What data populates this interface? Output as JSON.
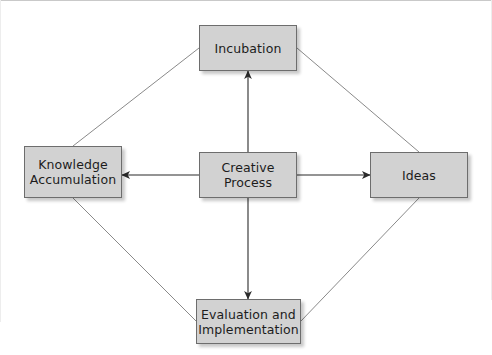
{
  "diagram": {
    "type": "node-link-diagram",
    "canvas": {
      "width": 492,
      "height": 355,
      "background": "#ffffff"
    },
    "style": {
      "node_fill": "#d2d2d2",
      "node_border": "#6d6d6d",
      "edge_color": "#8a8a8a",
      "arrow_color": "#2b2b2b",
      "text_color": "#1c1c1c",
      "frame_color": "#c9c9c9"
    },
    "nodes": [
      {
        "id": "incubation",
        "label": "Incubation",
        "x": 199,
        "y": 25,
        "w": 98,
        "h": 46,
        "position": "top"
      },
      {
        "id": "knowledge-accumulation",
        "label": "Knowledge\nAccumulation",
        "x": 24,
        "y": 146,
        "w": 98,
        "h": 52,
        "position": "left"
      },
      {
        "id": "creative-process",
        "label": "Creative\nProcess",
        "x": 199,
        "y": 152,
        "w": 98,
        "h": 46,
        "position": "center"
      },
      {
        "id": "ideas",
        "label": "Ideas",
        "x": 370,
        "y": 152,
        "w": 98,
        "h": 46,
        "position": "right"
      },
      {
        "id": "evaluation-implementation",
        "label": "Evaluation and\nImplementation",
        "x": 196,
        "y": 299,
        "w": 105,
        "h": 45,
        "position": "bottom"
      }
    ],
    "edges": [
      {
        "id": "creative-process-to-incubation",
        "from": "creative-process",
        "to": "incubation",
        "kind": "arrow",
        "direction": "up",
        "x1": 248,
        "y1": 152,
        "x2": 248,
        "y2": 71
      },
      {
        "id": "creative-process-to-knowledge-accumulation",
        "from": "creative-process",
        "to": "knowledge-accumulation",
        "kind": "arrow",
        "direction": "left",
        "x1": 199,
        "y1": 175,
        "x2": 122,
        "y2": 175
      },
      {
        "id": "creative-process-to-ideas",
        "from": "creative-process",
        "to": "ideas",
        "kind": "arrow",
        "direction": "right",
        "x1": 297,
        "y1": 175,
        "x2": 370,
        "y2": 175
      },
      {
        "id": "creative-process-to-evaluation-implementation",
        "from": "creative-process",
        "to": "evaluation-implementation",
        "kind": "arrow",
        "direction": "down",
        "x1": 248,
        "y1": 198,
        "x2": 248,
        "y2": 299
      },
      {
        "id": "knowledge-accumulation-to-incubation",
        "from": "knowledge-accumulation",
        "to": "incubation",
        "kind": "line",
        "direction": "none",
        "x1": 73,
        "y1": 146,
        "x2": 199,
        "y2": 48
      },
      {
        "id": "incubation-to-ideas",
        "from": "incubation",
        "to": "ideas",
        "kind": "line",
        "direction": "none",
        "x1": 297,
        "y1": 48,
        "x2": 419,
        "y2": 152
      },
      {
        "id": "knowledge-accumulation-to-evaluation-implementation",
        "from": "knowledge-accumulation",
        "to": "evaluation-implementation",
        "kind": "line",
        "direction": "none",
        "x1": 73,
        "y1": 198,
        "x2": 196,
        "y2": 321
      },
      {
        "id": "ideas-to-evaluation-implementation",
        "from": "ideas",
        "to": "evaluation-implementation",
        "kind": "line",
        "direction": "none",
        "x1": 419,
        "y1": 198,
        "x2": 301,
        "y2": 321
      }
    ]
  }
}
